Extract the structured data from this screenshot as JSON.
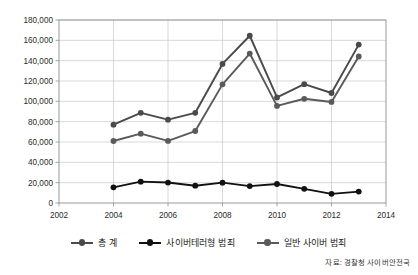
{
  "chart_data": {
    "type": "line",
    "title": "",
    "subtitle": "",
    "xlabel": "",
    "ylabel": "",
    "xlim": [
      2002,
      2014
    ],
    "ylim": [
      0,
      180000
    ],
    "grid": true,
    "legend_position": "bottom",
    "x": [
      2004,
      2005,
      2006,
      2007,
      2008,
      2009,
      2010,
      2011,
      2012,
      2013
    ],
    "xticks": [
      "2002",
      "2004",
      "2006",
      "2008",
      "2010",
      "2012",
      "2014"
    ],
    "xtick_values": [
      2002,
      2004,
      2006,
      2008,
      2010,
      2012,
      2014
    ],
    "yticks": [
      "0",
      "20,000",
      "40,000",
      "60,000",
      "80,000",
      "100,000",
      "120,000",
      "140,000",
      "160,000",
      "180,000"
    ],
    "ytick_values": [
      0,
      20000,
      40000,
      60000,
      80000,
      100000,
      120000,
      140000,
      160000,
      180000
    ],
    "series": [
      {
        "name": "총 계",
        "color": "#4a4a4a",
        "marker": "circle",
        "values": [
          77000,
          88700,
          82000,
          88700,
          136800,
          164500,
          103800,
          116900,
          108200,
          155800
        ]
      },
      {
        "name": "사이버테러형 범죄",
        "color": "#111111",
        "marker": "circle",
        "values": [
          15400,
          21000,
          20100,
          17000,
          20000,
          16600,
          18700,
          13900,
          9000,
          11200
        ]
      },
      {
        "name": "일반 사이버 범죄",
        "color": "#5a5a5a",
        "marker": "circle",
        "values": [
          61000,
          68200,
          61100,
          70800,
          116700,
          147000,
          95500,
          102500,
          99400,
          144100
        ]
      }
    ]
  },
  "source": {
    "note": "자료: 경찰청 사이버안전국"
  },
  "legend": {
    "items": [
      {
        "label": "총 계",
        "color": "#4a4a4a"
      },
      {
        "label": "사이버테러형 범죄",
        "color": "#111111"
      },
      {
        "label": "일반 사이버 범죄",
        "color": "#5a5a5a"
      }
    ]
  }
}
